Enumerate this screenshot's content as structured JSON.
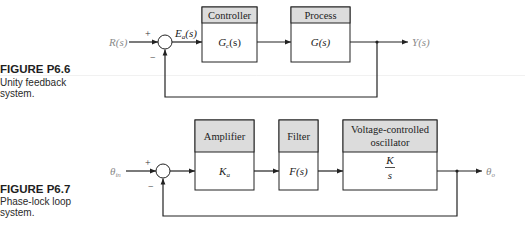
{
  "figures": [
    {
      "caption": {
        "label": "FIGURE P6.6",
        "line1": "Unity feedback",
        "line2": "system."
      },
      "input": {
        "main": "R",
        "rest": "(s)"
      },
      "output": {
        "main": "Y",
        "rest": "(s)"
      },
      "error": {
        "main": "E",
        "sub": "a",
        "rest": "(s)"
      },
      "sum": {
        "plus": "+",
        "minus": "−"
      },
      "blocks": [
        {
          "header": "Controller",
          "body": {
            "main": "G",
            "sub": "c",
            "rest": "(s)"
          }
        },
        {
          "header": "Process",
          "body": {
            "main": "G",
            "rest": "(s)"
          }
        }
      ]
    },
    {
      "caption": {
        "label": "FIGURE P6.7",
        "line1": "Phase-lock loop",
        "line2": "system."
      },
      "input": {
        "main": "θ",
        "sub": "in"
      },
      "output": {
        "main": "θ",
        "sub": "o"
      },
      "sum": {
        "plus": "+",
        "minus": "−"
      },
      "blocks": [
        {
          "header": "Amplifier",
          "body": {
            "main": "K",
            "sub": "a"
          }
        },
        {
          "header": "Filter",
          "body": {
            "main": "F",
            "rest": "(s)"
          }
        },
        {
          "header_line1": "Voltage-controlled",
          "header_line2": "oscillator",
          "body": {
            "numerator": "K",
            "denominator": "s"
          }
        }
      ]
    }
  ],
  "colors": {
    "block_header_fill": "#dcdcdc",
    "line": "#222222",
    "io_label": "#8a8a8a"
  }
}
